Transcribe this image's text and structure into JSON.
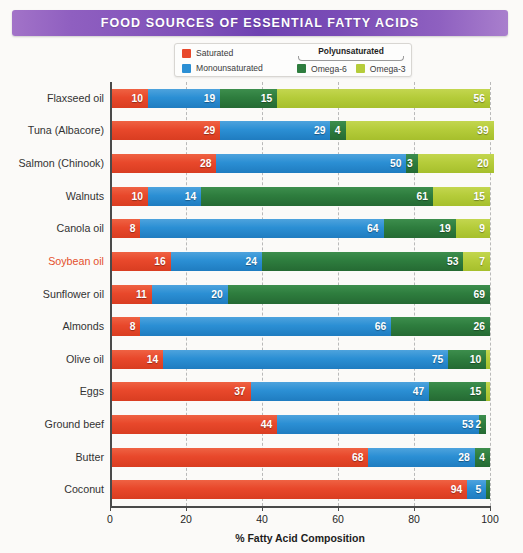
{
  "banner": {
    "title": "FOOD SOURCES OF ESSENTIAL FATTY ACIDS"
  },
  "legend": {
    "saturated_label": "Saturated",
    "monounsaturated_label": "Monounsaturated",
    "group_title": "Polyunsaturated",
    "omega6_label": "Omega-6",
    "omega3_label": "Omega-3"
  },
  "colors": {
    "saturated": "#e8482b",
    "monounsaturated": "#2b8fd4",
    "omega6": "#2e7d3e",
    "omega3": "#b5cc3a",
    "banner_purple": "#7d4fb8",
    "highlight_label": "#e4502c",
    "axis": "#4a4a4a",
    "gridline": "#b9b9b9"
  },
  "chart_data": {
    "type": "bar",
    "orientation": "horizontal",
    "stacked": true,
    "title": "FOOD SOURCES OF ESSENTIAL FATTY ACIDS",
    "xlabel": "% Fatty Acid Composition",
    "ylabel": "",
    "xlim": [
      0,
      100
    ],
    "xticks": [
      0,
      20,
      40,
      60,
      80,
      100
    ],
    "xticklabels": [
      "0",
      "20",
      "40",
      "60",
      "80",
      "100"
    ],
    "grid": "vertical-dashed",
    "legend_position": "above-plot",
    "series": [
      {
        "name": "Saturated",
        "color": "#e8482b",
        "values": [
          10,
          29,
          28,
          10,
          8,
          16,
          11,
          8,
          14,
          37,
          44,
          68,
          94
        ]
      },
      {
        "name": "Monounsaturated",
        "color": "#2b8fd4",
        "values": [
          19,
          29,
          50,
          14,
          64,
          24,
          20,
          66,
          75,
          47,
          53,
          28,
          5
        ]
      },
      {
        "name": "Omega-6",
        "color": "#2e7d3e",
        "values": [
          15,
          4,
          3,
          61,
          19,
          53,
          69,
          26,
          10,
          15,
          2,
          4,
          1
        ]
      },
      {
        "name": "Omega-3",
        "color": "#b5cc3a",
        "values": [
          56,
          39,
          20,
          15,
          9,
          7,
          0,
          0,
          1,
          1,
          0,
          0,
          0
        ]
      }
    ],
    "categories": [
      "Flaxseed oil",
      "Tuna (Albacore)",
      "Salmon (Chinook)",
      "Walnuts",
      "Canola oil",
      "Soybean oil",
      "Sunflower oil",
      "Almonds",
      "Olive oil",
      "Eggs",
      "Ground beef",
      "Butter",
      "Coconut"
    ],
    "rows": [
      {
        "label": "Flaxseed oil",
        "highlighted": false,
        "saturated": 10,
        "monounsaturated": 19,
        "omega6": 15,
        "omega3": 56,
        "labels": {
          "saturated": "10",
          "monounsaturated": "19",
          "omega6": "15",
          "omega3": "56"
        }
      },
      {
        "label": "Tuna (Albacore)",
        "highlighted": false,
        "saturated": 29,
        "monounsaturated": 29,
        "omega6": 4,
        "omega3": 39,
        "labels": {
          "saturated": "29",
          "monounsaturated": "29",
          "omega6": "4",
          "omega3": "39"
        }
      },
      {
        "label": "Salmon (Chinook)",
        "highlighted": false,
        "saturated": 28,
        "monounsaturated": 50,
        "omega6": 3,
        "omega3": 20,
        "labels": {
          "saturated": "28",
          "monounsaturated": "50",
          "omega6": "3",
          "omega3": "20"
        }
      },
      {
        "label": "Walnuts",
        "highlighted": false,
        "saturated": 10,
        "monounsaturated": 14,
        "omega6": 61,
        "omega3": 15,
        "labels": {
          "saturated": "10",
          "monounsaturated": "14",
          "omega6": "61",
          "omega3": "15"
        }
      },
      {
        "label": "Canola oil",
        "highlighted": false,
        "saturated": 8,
        "monounsaturated": 64,
        "omega6": 19,
        "omega3": 9,
        "labels": {
          "saturated": "8",
          "monounsaturated": "64",
          "omega6": "19",
          "omega3": "9"
        }
      },
      {
        "label": "Soybean oil",
        "highlighted": true,
        "saturated": 16,
        "monounsaturated": 24,
        "omega6": 53,
        "omega3": 7,
        "labels": {
          "saturated": "16",
          "monounsaturated": "24",
          "omega6": "53",
          "omega3": "7"
        }
      },
      {
        "label": "Sunflower oil",
        "highlighted": false,
        "saturated": 11,
        "monounsaturated": 20,
        "omega6": 69,
        "omega3": 0,
        "labels": {
          "saturated": "11",
          "monounsaturated": "20",
          "omega6": "69",
          "omega3": ""
        }
      },
      {
        "label": "Almonds",
        "highlighted": false,
        "saturated": 8,
        "monounsaturated": 66,
        "omega6": 26,
        "omega3": 0,
        "labels": {
          "saturated": "8",
          "monounsaturated": "66",
          "omega6": "26",
          "omega3": ""
        }
      },
      {
        "label": "Olive oil",
        "highlighted": false,
        "saturated": 14,
        "monounsaturated": 75,
        "omega6": 10,
        "omega3": 1,
        "labels": {
          "saturated": "14",
          "monounsaturated": "75",
          "omega6": "10",
          "omega3": ""
        }
      },
      {
        "label": "Eggs",
        "highlighted": false,
        "saturated": 37,
        "monounsaturated": 47,
        "omega6": 15,
        "omega3": 1,
        "labels": {
          "saturated": "37",
          "monounsaturated": "47",
          "omega6": "15",
          "omega3": ""
        }
      },
      {
        "label": "Ground beef",
        "highlighted": false,
        "saturated": 44,
        "monounsaturated": 53,
        "omega6": 2,
        "omega3": 0,
        "labels": {
          "saturated": "44",
          "monounsaturated": "53",
          "omega6": "2",
          "omega3": ""
        }
      },
      {
        "label": "Butter",
        "highlighted": false,
        "saturated": 68,
        "monounsaturated": 28,
        "omega6": 4,
        "omega3": 0,
        "labels": {
          "saturated": "68",
          "monounsaturated": "28",
          "omega6": "4",
          "omega3": ""
        }
      },
      {
        "label": "Coconut",
        "highlighted": false,
        "saturated": 94,
        "monounsaturated": 5,
        "omega6": 1,
        "omega3": 0,
        "labels": {
          "saturated": "94",
          "monounsaturated": "5",
          "omega6": "",
          "omega3": ""
        }
      }
    ]
  }
}
